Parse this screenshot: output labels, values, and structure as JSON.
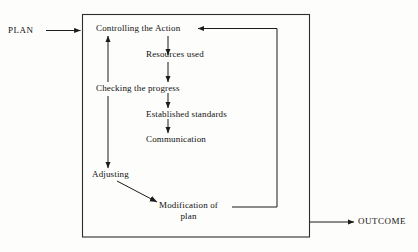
{
  "diagram": {
    "type": "flowchart",
    "colors": {
      "ink": "#111111",
      "line": "#2a2a2a",
      "paper": "#fdfdfb"
    },
    "boundary": {
      "name": "control-system-boundary",
      "shape": "rectangle"
    },
    "terminals": {
      "input": {
        "label": "PLAN",
        "position": "left-outside"
      },
      "output": {
        "label": "OUTCOME",
        "position": "right-outside"
      }
    },
    "nodes": [
      {
        "id": "controlling-the-action",
        "label": "Controlling the Action"
      },
      {
        "id": "resources-used",
        "label": "Resources used"
      },
      {
        "id": "checking-the-progress",
        "label": "Checking the progress"
      },
      {
        "id": "established-standards",
        "label": "Established standards"
      },
      {
        "id": "communication",
        "label": "Communication"
      },
      {
        "id": "adjusting",
        "label": "Adjusting"
      },
      {
        "id": "modification-of-plan",
        "label_line1": "Modification of",
        "label_line2": "plan"
      }
    ],
    "connections": [
      {
        "id": "plan-to-controlling",
        "from": "PLAN",
        "to": "Controlling the Action",
        "style": "arrow"
      },
      {
        "id": "controlling-to-resources",
        "from": "Controlling the Action",
        "to": "Resources used",
        "style": "arrow"
      },
      {
        "id": "resources-to-checking",
        "from": "Resources used",
        "to": "Checking the progress",
        "style": "arrow"
      },
      {
        "id": "checking-to-established",
        "from": "Checking the progress",
        "to": "Established standards",
        "style": "arrow"
      },
      {
        "id": "established-to-communication",
        "from": "Established standards",
        "to": "Communication",
        "style": "arrow"
      },
      {
        "id": "checking-to-controlling",
        "from": "Checking the progress",
        "to": "Controlling the Action",
        "style": "arrow-up"
      },
      {
        "id": "checking-to-adjusting",
        "from": "Checking the progress",
        "to": "Adjusting",
        "style": "arrow-down"
      },
      {
        "id": "adjusting-to-modification",
        "from": "Adjusting",
        "to": "Modification of plan",
        "style": "diagonal-arrow"
      },
      {
        "id": "modification-to-controlling",
        "from": "Modification of plan",
        "to": "Controlling the Action",
        "style": "feedback-loop"
      },
      {
        "id": "boundary-to-outcome",
        "from": "control-system-boundary",
        "to": "OUTCOME",
        "style": "arrow"
      }
    ]
  }
}
